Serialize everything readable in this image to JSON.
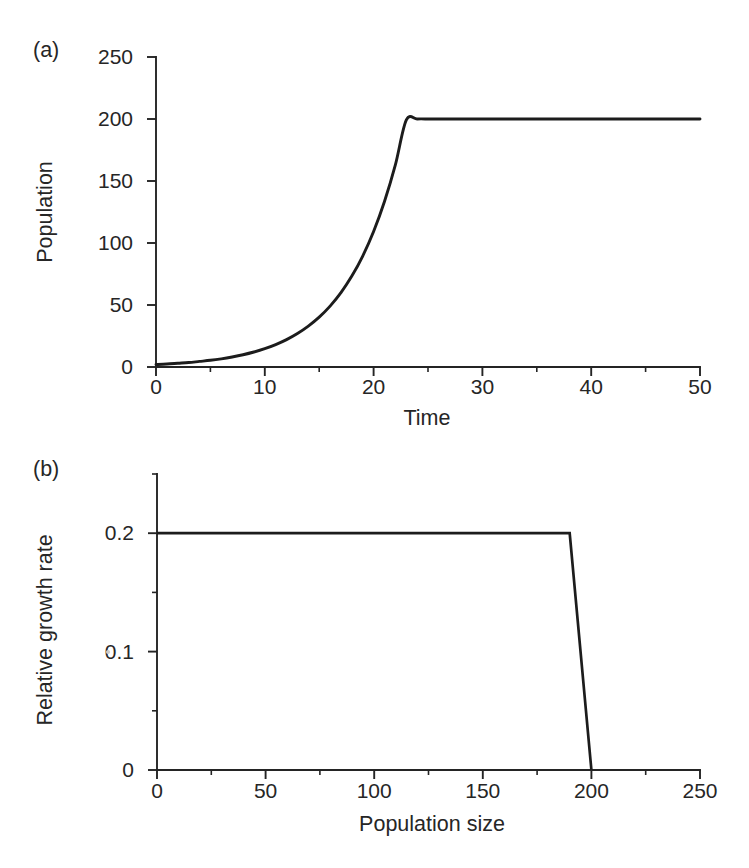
{
  "figure": {
    "background_color": "#ffffff",
    "ink_color": "#1c1c1c",
    "panels": [
      {
        "id": "a",
        "label": "(a)",
        "chart_ref": 0
      },
      {
        "id": "b",
        "label": "(b)",
        "chart_ref": 1
      }
    ]
  },
  "chart_data": [
    {
      "type": "line",
      "panel": "(a)",
      "title": "",
      "xlabel": "Time",
      "ylabel": "Population",
      "xlim": [
        0,
        50
      ],
      "ylim": [
        0,
        250
      ],
      "grid": false,
      "legend": null,
      "xticks": [
        0,
        10,
        20,
        30,
        40,
        50
      ],
      "xticklabels": [
        "0",
        "10",
        "20",
        "30",
        "40",
        "50"
      ],
      "xticks_minor": [
        5,
        15,
        25,
        35,
        45
      ],
      "yticks": [
        0,
        50,
        100,
        150,
        200,
        250
      ],
      "yticklabels": [
        "0",
        "50",
        "100",
        "150",
        "200",
        "250"
      ],
      "yticks_minor": [],
      "series": [
        {
          "name": "Population over time",
          "description": "Exponential growth from N0 = 2 at rate r = 0.2, capped at ceiling K = 200 reached near t = 26",
          "x": [
            0,
            1,
            2,
            3,
            4,
            5,
            6,
            7,
            8,
            9,
            10,
            11,
            12,
            13,
            14,
            15,
            16,
            17,
            18,
            19,
            20,
            21,
            22,
            23,
            24,
            25,
            25.5,
            26,
            27,
            28,
            30,
            32,
            35,
            38,
            40,
            42,
            45,
            48,
            50
          ],
          "y": [
            2,
            2.4,
            3.0,
            3.6,
            4.5,
            5.4,
            6.6,
            8.1,
            9.9,
            12.1,
            14.8,
            18.1,
            22.1,
            27.0,
            33.0,
            40.2,
            49.1,
            60.0,
            73.3,
            89.5,
            109.3,
            133.5,
            163.0,
            199.1,
            200,
            200,
            200,
            200,
            200,
            200,
            200,
            200,
            200,
            200,
            200,
            200,
            200,
            200,
            200
          ]
        }
      ]
    },
    {
      "type": "line",
      "panel": "(b)",
      "title": "",
      "xlabel": "Population size",
      "ylabel": "Relative growth rate",
      "xlim": [
        0,
        250
      ],
      "ylim": [
        0,
        0.25
      ],
      "grid": false,
      "legend": null,
      "xticks": [
        0,
        50,
        100,
        150,
        200,
        250
      ],
      "xticklabels": [
        "0",
        "50",
        "100",
        "150",
        "200",
        "250"
      ],
      "xticks_minor": [
        25,
        75,
        125,
        175,
        225
      ],
      "yticks": [
        0,
        0.1,
        0.2
      ],
      "yticklabels": [
        "0",
        "0.1",
        "0.2"
      ],
      "yticks_minor": [
        0.05,
        0.15,
        0.25
      ],
      "series": [
        {
          "name": "Relative growth rate vs population size",
          "description": "Constant rate r = 0.2 until population size 190, then falls linearly to 0 at the ceiling 200",
          "x": [
            0,
            50,
            100,
            150,
            190,
            200
          ],
          "y": [
            0.2,
            0.2,
            0.2,
            0.2,
            0.2,
            0
          ]
        }
      ]
    }
  ]
}
